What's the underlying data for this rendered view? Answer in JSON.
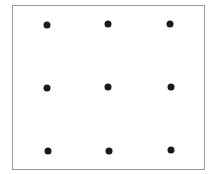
{
  "diagram": {
    "type": "dot-grid",
    "rows": 3,
    "columns": 3,
    "frame_color": "#9a9a9a",
    "dot_color": "#1a1a1a",
    "dots": [
      {
        "row": 1,
        "col": 1,
        "x": 47,
        "y": 25
      },
      {
        "row": 1,
        "col": 2,
        "x": 108,
        "y": 24
      },
      {
        "row": 1,
        "col": 3,
        "x": 170,
        "y": 24
      },
      {
        "row": 2,
        "col": 1,
        "x": 47,
        "y": 88
      },
      {
        "row": 2,
        "col": 2,
        "x": 108,
        "y": 87
      },
      {
        "row": 2,
        "col": 3,
        "x": 171,
        "y": 87
      },
      {
        "row": 3,
        "col": 1,
        "x": 48,
        "y": 151
      },
      {
        "row": 3,
        "col": 2,
        "x": 109,
        "y": 151
      },
      {
        "row": 3,
        "col": 3,
        "x": 171,
        "y": 150
      }
    ]
  }
}
